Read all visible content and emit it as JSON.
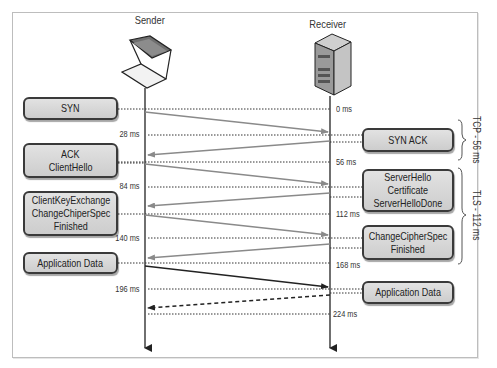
{
  "nodes": {
    "sender": {
      "label": "Sender",
      "icon": "laptop-icon"
    },
    "receiver": {
      "label": "Receiver",
      "icon": "server-icon"
    }
  },
  "sender_messages": [
    {
      "lines": [
        "SYN"
      ]
    },
    {
      "lines": [
        "ACK",
        "ClientHello"
      ]
    },
    {
      "lines": [
        "ClientKeyExchange",
        "ChangeChiperSpec",
        "Finished"
      ]
    },
    {
      "lines": [
        "Application Data"
      ]
    }
  ],
  "receiver_messages": [
    {
      "lines": [
        "SYN ACK"
      ]
    },
    {
      "lines": [
        "ServerHello",
        "Certificate",
        "ServerHelloDone"
      ]
    },
    {
      "lines": [
        "ChangeCipherSpec",
        "Finished"
      ]
    },
    {
      "lines": [
        "Application Data"
      ]
    }
  ],
  "timestamps": {
    "receiver_side": [
      "0 ms",
      "56 ms",
      "112 ms",
      "168 ms",
      "224 ms"
    ],
    "sender_side": [
      "28 ms",
      "84 ms",
      "140 ms",
      "196 ms"
    ]
  },
  "phases": [
    {
      "label": "TCP - 56 ms"
    },
    {
      "label": "TLS - 112 ms"
    }
  ],
  "colors": {
    "box_fill": "#d6d6d6",
    "box_border": "#3a3a3a",
    "handshake_arrow": "#8a8a8a",
    "data_arrow": "#222222",
    "timeline": "#222222"
  }
}
